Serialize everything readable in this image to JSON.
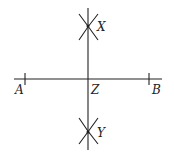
{
  "diagram": {
    "type": "perpendicular-bisector-construction",
    "labels": {
      "A": "A",
      "B": "B",
      "X": "X",
      "Y": "Y",
      "Z": "Z"
    },
    "color": "#222222"
  }
}
